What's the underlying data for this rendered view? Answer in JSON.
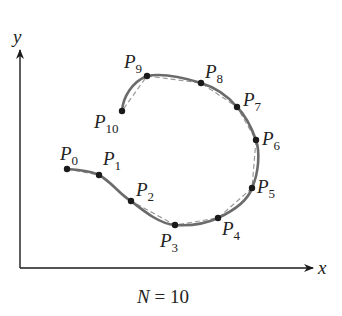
{
  "axes": {
    "x_label": "x",
    "y_label": "y"
  },
  "caption": {
    "lhs": "N",
    "eq": " = ",
    "rhs": "10"
  },
  "colors": {
    "curve": "#6b6b6b",
    "polygon": "#9a9a9a",
    "point": "#1a1a1a",
    "axis": "#1a1a1a"
  },
  "points": [
    {
      "name": "P",
      "index": "0",
      "x": 67,
      "y": 169
    },
    {
      "name": "P",
      "index": "1",
      "x": 99,
      "y": 175
    },
    {
      "name": "P",
      "index": "2",
      "x": 131,
      "y": 201
    },
    {
      "name": "P",
      "index": "3",
      "x": 175,
      "y": 225
    },
    {
      "name": "P",
      "index": "4",
      "x": 218,
      "y": 218
    },
    {
      "name": "P",
      "index": "5",
      "x": 252,
      "y": 188
    },
    {
      "name": "P",
      "index": "6",
      "x": 256,
      "y": 140
    },
    {
      "name": "P",
      "index": "7",
      "x": 237,
      "y": 107
    },
    {
      "name": "P",
      "index": "8",
      "x": 201,
      "y": 83
    },
    {
      "name": "P",
      "index": "9",
      "x": 147,
      "y": 76
    },
    {
      "name": "P",
      "index": "10",
      "x": 122,
      "y": 111
    }
  ]
}
